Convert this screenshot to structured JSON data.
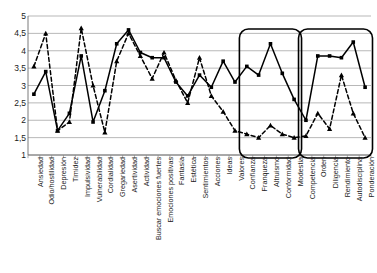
{
  "chart_data": {
    "type": "line",
    "title": "",
    "subtitle": "",
    "xlabel": "",
    "ylabel": "",
    "ylim": [
      1,
      5
    ],
    "ytick_labels": [
      "1",
      "1,5",
      "2",
      "2,5",
      "3",
      "3,5",
      "4",
      "4,5",
      "5"
    ],
    "ytick_values": [
      1,
      1.5,
      2,
      2.5,
      3,
      3.5,
      4,
      4.5,
      5
    ],
    "grid": true,
    "legend_position": "none",
    "categories": [
      "Ansiedad",
      "Odio/hostilidad",
      "Depresión",
      "Timidez",
      "Impulsividad",
      "Vulnerabilidad",
      "Cordialidad",
      "Gregariedad",
      "Asertividad",
      "Actividad",
      "Buscar emociones fuertes",
      "Emociones positivas",
      "Fantasía",
      "Estética",
      "Sentimientos",
      "Acciones",
      "Ideas",
      "Valores",
      "Confianza",
      "Franqueza",
      "Altruismo",
      "Conformidad",
      "Modestia",
      "Competencia",
      "Orden",
      "Diligencia",
      "Rendimiento",
      "Autodisciplina",
      "Ponderación"
    ],
    "series": [
      {
        "name": "Serie 1",
        "style": "solid",
        "marker": "square",
        "color": "#000000",
        "values": [
          2.75,
          3.4,
          1.7,
          2.2,
          3.85,
          1.95,
          2.85,
          4.2,
          4.6,
          3.95,
          3.8,
          3.8,
          3.1,
          2.7,
          3.3,
          2.95,
          3.7,
          3.1,
          3.55,
          3.3,
          4.2,
          3.35,
          2.6,
          2.0,
          3.85,
          3.85,
          3.8,
          4.25,
          2.95
        ]
      },
      {
        "name": "Serie 2",
        "style": "dashed",
        "marker": "triangle",
        "color": "#000000",
        "values": [
          3.55,
          4.5,
          1.7,
          1.95,
          4.65,
          3.0,
          1.65,
          3.7,
          4.5,
          3.85,
          3.2,
          3.95,
          3.15,
          2.5,
          3.8,
          2.7,
          2.25,
          1.7,
          1.6,
          1.5,
          1.85,
          1.6,
          1.5,
          1.55,
          2.2,
          1.75,
          3.3,
          2.2,
          1.5
        ]
      }
    ],
    "highlight_boxes": [
      {
        "name": "agreeableness-group",
        "from_category": "Confianza",
        "to_category": "Modestia"
      },
      {
        "name": "conscientiousness-group",
        "from_category": "Competencia",
        "to_category": "Ponderación"
      }
    ]
  }
}
